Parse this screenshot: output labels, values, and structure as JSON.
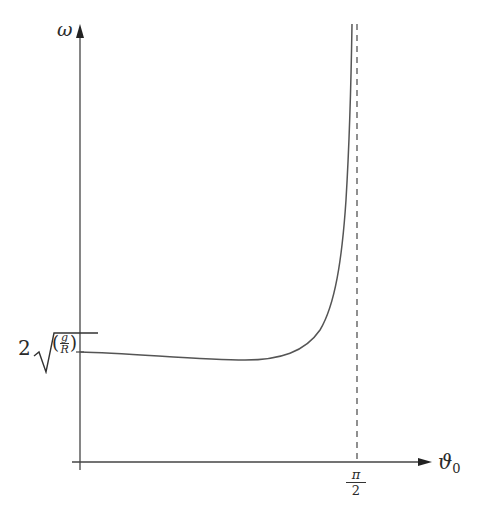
{
  "figure": {
    "type": "function-sketch",
    "y_axis": {
      "label": "ω"
    },
    "x_axis": {
      "label_main": "ϑ",
      "label_sub": "0"
    },
    "asymptote": {
      "x_label_num": "π",
      "x_label_den": "2",
      "style": "dashed"
    },
    "y_intercept_label": {
      "coefficient": "2",
      "radical": "√",
      "open_paren": "(",
      "frac_num": "g",
      "frac_den": "R",
      "close_paren": ")"
    },
    "curve": {
      "description": "Starts at 2√(g/R) at ϑ0 = 0, dips slightly, then rises steeply toward infinity approaching the vertical asymptote at ϑ0 = π/2"
    },
    "colors": {
      "ink": "#333333",
      "curve": "#555555",
      "background": "#ffffff"
    }
  }
}
